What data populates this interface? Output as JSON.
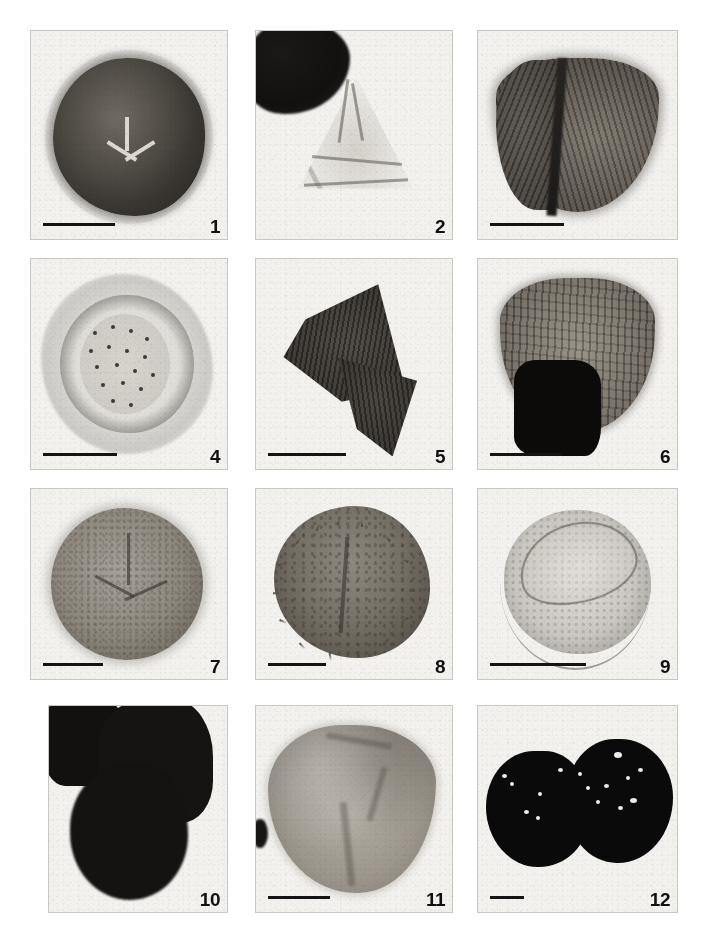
{
  "plate": {
    "title": "Photomicrograph plate of fossil spores and pollen",
    "background_color": "#ffffff",
    "panel_background_color": "#f2f1ee",
    "panel_border_color": "#c9c7c2",
    "label_color": "#111111",
    "scalebar_color": "#141414",
    "columns": 3,
    "rows": 4,
    "figure_count": 12
  },
  "figures": [
    {
      "number": "1",
      "row": 1,
      "column": 1,
      "has_scalebar": true,
      "scalebar_length_px": 72,
      "description": "Dark rounded trilete spore in proximal view with prominent Y-shaped trilete mark"
    },
    {
      "number": "2",
      "row": 1,
      "column": 2,
      "has_scalebar": false,
      "scalebar_length_px": 0,
      "description": "Pale translucent triangular spore with folded wall; opaque dark debris at upper left"
    },
    {
      "number": "",
      "row": 1,
      "column": 3,
      "has_scalebar": true,
      "scalebar_length_px": 74,
      "description": "Triangular striate spore with strong ribbing and dark proximal ridge"
    },
    {
      "number": "4",
      "row": 2,
      "column": 1,
      "has_scalebar": true,
      "scalebar_length_px": 74,
      "description": "Pale spore surrounded by a loose perine halo; dark punctate grana on the central body"
    },
    {
      "number": "5",
      "row": 2,
      "column": 2,
      "has_scalebar": true,
      "scalebar_length_px": 78,
      "description": "Dark folded striate spore, compressed and creased into two lobes"
    },
    {
      "number": "6",
      "row": 2,
      "column": 3,
      "has_scalebar": true,
      "scalebar_length_px": 72,
      "description": "Ribbed cingulate spore overlain by a large opaque black mineral fragment"
    },
    {
      "number": "7",
      "row": 3,
      "column": 1,
      "has_scalebar": true,
      "scalebar_length_px": 60,
      "description": "Pale granulate trilete spore, rounded outline, trilete rays clearly visible"
    },
    {
      "number": "8",
      "row": 3,
      "column": 2,
      "has_scalebar": true,
      "scalebar_length_px": 58,
      "description": "Echinate (spiny) spore with scattered conical spines on the outline and dark grana"
    },
    {
      "number": "9",
      "row": 3,
      "column": 3,
      "has_scalebar": true,
      "scalebar_length_px": 96,
      "description": "Pale monolete spore with a raised laesura lip and thin outer ring"
    },
    {
      "number": "10",
      "row": 4,
      "column": 1,
      "has_scalebar": false,
      "scalebar_length_px": 0,
      "description": "Cluster of opaque black carbonised grains, detail obscured"
    },
    {
      "number": "11",
      "row": 4,
      "column": 2,
      "has_scalebar": true,
      "scalebar_length_px": 62,
      "description": "Large pale grey grain with broad folds; small dark fragment at left edge"
    },
    {
      "number": "12",
      "row": 4,
      "column": 3,
      "has_scalebar": true,
      "scalebar_length_px": 34,
      "description": "Two conjoined opaque black grains perforated by scattered white pits"
    }
  ]
}
